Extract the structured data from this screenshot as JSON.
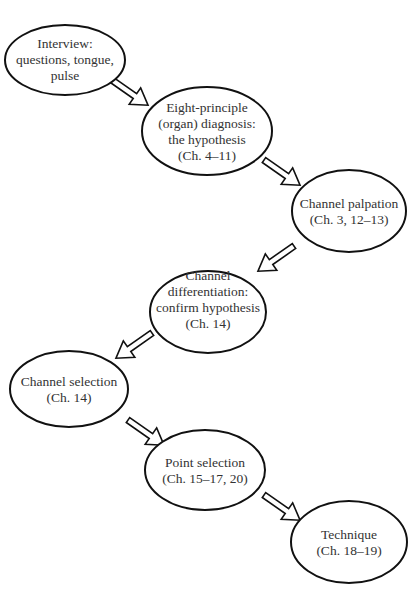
{
  "diagram": {
    "nodes": [
      {
        "id": "interview",
        "lines": [
          "Interview:",
          "questions, tongue,",
          "pulse"
        ]
      },
      {
        "id": "eight-principle",
        "lines": [
          "Eight-principle",
          "(organ) diagnosis:",
          "the hypothesis",
          "(Ch. 4–11)"
        ]
      },
      {
        "id": "channel-palpation",
        "lines": [
          "Channel palpation",
          "(Ch. 3, 12–13)"
        ]
      },
      {
        "id": "channel-differentiation",
        "lines": [
          "Channel",
          "differentiation:",
          "confirm hypothesis",
          "(Ch. 14)"
        ]
      },
      {
        "id": "channel-selection",
        "lines": [
          "Channel selection",
          "(Ch. 14)"
        ]
      },
      {
        "id": "point-selection",
        "lines": [
          "Point selection",
          "(Ch. 15–17, 20)"
        ]
      },
      {
        "id": "technique",
        "lines": [
          "Technique",
          "(Ch. 18–19)"
        ]
      }
    ],
    "edges": [
      {
        "from": "interview",
        "to": "eight-principle"
      },
      {
        "from": "eight-principle",
        "to": "channel-palpation"
      },
      {
        "from": "channel-palpation",
        "to": "channel-differentiation"
      },
      {
        "from": "channel-differentiation",
        "to": "channel-selection"
      },
      {
        "from": "channel-selection",
        "to": "point-selection"
      },
      {
        "from": "point-selection",
        "to": "technique"
      }
    ],
    "colors": {
      "stroke": "#111111",
      "text": "#333333",
      "fill": "#ffffff"
    }
  }
}
